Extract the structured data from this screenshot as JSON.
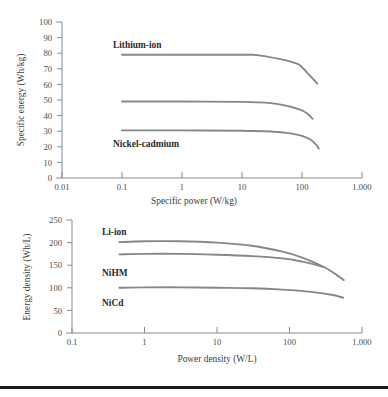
{
  "figure": {
    "name": "battery-ragone-figure",
    "background": "#ffffff",
    "curve_color": "#878787",
    "axis_color": "#8b8b8b",
    "text_color": "#3a3a3a",
    "rule_color": "#1b1b1b"
  },
  "chart_data": [
    {
      "id": "specific-energy-vs-specific-power",
      "type": "line",
      "title": "",
      "xlabel": "Specific power (W/kg)",
      "ylabel": "Specific energy (Wh/kg)",
      "xscale": "log",
      "xlim": [
        0.01,
        1000
      ],
      "ylim": [
        0,
        100
      ],
      "xticks": [
        0.01,
        0.1,
        1,
        10,
        100,
        1000
      ],
      "xtick_labels": [
        "0.01",
        "0.1",
        "1",
        "10",
        "100",
        "1,000"
      ],
      "yticks": [
        0,
        10,
        20,
        30,
        40,
        50,
        60,
        70,
        80,
        90,
        100
      ],
      "ytick_labels": [
        "0",
        "10",
        "20",
        "30",
        "40",
        "50",
        "60",
        "70",
        "80",
        "90",
        "100"
      ],
      "grid": false,
      "legend": "inline-annotations",
      "series": [
        {
          "name": "Lithium-ion",
          "label_position": "above-left",
          "x": [
            0.1,
            1,
            5,
            15,
            20,
            40,
            80,
            100,
            140,
            180
          ],
          "y": [
            79,
            79,
            79,
            79,
            78.5,
            76.5,
            73.5,
            71,
            65,
            60.5
          ]
        },
        {
          "name": "Nickel-metal hydride",
          "label_position": "above-left",
          "x": [
            0.1,
            1,
            10,
            30,
            60,
            90,
            110,
            130,
            150
          ],
          "y": [
            49,
            49,
            48.8,
            48,
            46,
            44,
            42.5,
            40.5,
            38
          ]
        },
        {
          "name": "Nickel-cadmium",
          "label_position": "below-left",
          "x": [
            0.1,
            1,
            10,
            30,
            60,
            100,
            140,
            170,
            190
          ],
          "y": [
            30.5,
            30.5,
            30.3,
            29.8,
            28.8,
            27,
            24.5,
            21.5,
            18.8
          ]
        }
      ]
    },
    {
      "id": "energy-density-vs-power-density",
      "type": "line",
      "title": "",
      "xlabel": "Power density (W/L)",
      "ylabel": "Energy density (Wh/L)",
      "xscale": "log",
      "xlim": [
        0.1,
        1000
      ],
      "ylim": [
        0,
        250
      ],
      "xticks": [
        0.1,
        1,
        10,
        100,
        1000
      ],
      "xtick_labels": [
        "0.1",
        "1",
        "10",
        "100",
        "1,000"
      ],
      "yticks": [
        0,
        50,
        100,
        150,
        200,
        250
      ],
      "ytick_labels": [
        "0",
        "50",
        "100",
        "150",
        "200",
        "250"
      ],
      "grid": false,
      "legend": "inline-annotations",
      "series": [
        {
          "name": "Li-ion",
          "label_position": "above-left",
          "x": [
            0.45,
            1,
            3,
            10,
            30,
            80,
            150,
            300,
            450,
            560
          ],
          "y": [
            201,
            203,
            203,
            200,
            193,
            180,
            167,
            146,
            128,
            117
          ]
        },
        {
          "name": "NiHM",
          "label_position": "below-left",
          "x": [
            0.45,
            1,
            3,
            10,
            30,
            80,
            150,
            230,
            290
          ],
          "y": [
            174,
            175,
            175,
            173,
            170,
            165,
            158,
            151,
            146
          ]
        },
        {
          "name": "NiCd",
          "label_position": "below-left",
          "x": [
            0.45,
            1,
            3,
            10,
            30,
            80,
            200,
            400,
            550
          ],
          "y": [
            100,
            101,
            101,
            100,
            99,
            96,
            91,
            84,
            78
          ]
        }
      ]
    }
  ],
  "chart1_annotations": [
    {
      "text": "Lithium-ion",
      "x": 0.38,
      "y": 87
    },
    {
      "text": "Nickel-metal hydride",
      "x": 0.38,
      "y": 57
    },
    {
      "text": "Nickel-cadmium",
      "x": 0.38,
      "y": 23.5
    }
  ],
  "chart2_annotations": [
    {
      "text": "Li-ion",
      "x": 1.0,
      "y": 222
    },
    {
      "text": "NiHM",
      "x": 1.0,
      "y": 131
    },
    {
      "text": "NiCd",
      "x": 1.0,
      "y": 64
    }
  ]
}
